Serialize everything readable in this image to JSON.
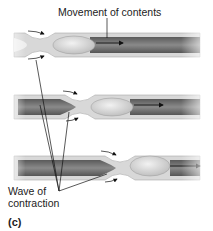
{
  "figure": {
    "panel_label": "(c)",
    "labels": {
      "movement": "Movement of contents",
      "wave_line1": "Wave of",
      "wave_line2": "contraction"
    },
    "stages": [
      {
        "name": "stage-1",
        "constriction_x": 40,
        "center_y": 45
      },
      {
        "name": "stage-2",
        "constriction_x": 80,
        "center_y": 107
      },
      {
        "name": "stage-3",
        "constriction_x": 120,
        "center_y": 168
      }
    ],
    "colors": {
      "tube_wall": "#d9d9d9",
      "tube_inner": "#7a7a7a",
      "bolus": "#e2e2e2",
      "line": "#222222"
    }
  }
}
